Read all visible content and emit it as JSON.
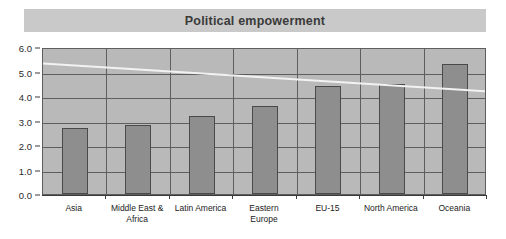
{
  "chart_data": {
    "type": "bar",
    "title": "Political empowerment",
    "xlabel": "",
    "ylabel": "",
    "ylim": [
      0.0,
      6.0
    ],
    "ytick_step": 1.0,
    "ytick_labels": [
      "6.0",
      "5.0",
      "4.0",
      "3.0",
      "2.0",
      "1.0",
      "0.0"
    ],
    "ytick_values": [
      6.0,
      5.0,
      4.0,
      3.0,
      2.0,
      1.0,
      0.0
    ],
    "grid": true,
    "legend": "none",
    "categories": [
      "Asia",
      "Middle East &\nAfrica",
      "Latin America",
      "Eastern\nEurope",
      "EU-15",
      "North America",
      "Oceania"
    ],
    "values": [
      2.7,
      2.8,
      3.2,
      3.6,
      4.4,
      4.5,
      5.3
    ],
    "series": [
      {
        "name": "Political empowerment",
        "values": [
          2.7,
          2.8,
          3.2,
          3.6,
          4.4,
          4.5,
          5.3
        ]
      },
      {
        "name": "trend-line",
        "type": "line",
        "color": "#f2f2f2",
        "start_value": 5.4,
        "end_value": 4.25
      }
    ],
    "colors": {
      "bar_fill": "#8e8e8e",
      "bar_edge": "#4a4a4a",
      "plot_background": "#b9b9b9",
      "title_band": "#c9c9c9",
      "trend_line": "#f2f2f2",
      "text": "#222222"
    }
  }
}
